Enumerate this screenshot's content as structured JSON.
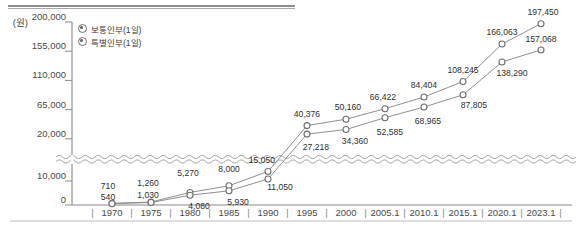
{
  "chart_data": {
    "type": "line",
    "title": "",
    "xlabel": "",
    "ylabel": "",
    "unit_label": "(원)",
    "grid": false,
    "legend_position": "top-left",
    "axis_break": true,
    "ylim": [
      0,
      200000
    ],
    "ytick_labels": [
      "200,000",
      "155,000",
      "110,000",
      "65,000",
      "20,000",
      "10,000",
      "0"
    ],
    "ytick_values": [
      200000,
      155000,
      110000,
      65000,
      20000,
      10000,
      0
    ],
    "categories": [
      "1970",
      "1975",
      "1980",
      "1985",
      "1990",
      "1995",
      "2000",
      "2005.1",
      "2010.1",
      "2015.1",
      "2020.1",
      "2023.1"
    ],
    "series": [
      {
        "name": "보통인부(1일)",
        "values": [
          710,
          1260,
          5270,
          8000,
          15050,
          40376,
          50160,
          66422,
          84404,
          108245,
          166063,
          197450
        ],
        "labels": [
          "710",
          "1,260",
          "5,270",
          "8,000",
          "15,050",
          "40,376",
          "50,160",
          "66,422",
          "84,404",
          "108,245",
          "166,063",
          "197,450"
        ]
      },
      {
        "name": "특별인부(1일)",
        "values": [
          540,
          1030,
          4080,
          5930,
          11050,
          27218,
          34360,
          52585,
          68965,
          87805,
          138290,
          157068
        ],
        "labels": [
          "540",
          "1,030",
          "4,080",
          "5,930",
          "11,050",
          "27,218",
          "34,360",
          "52,585",
          "68,965",
          "87,805",
          "138,290",
          "157,068"
        ]
      }
    ]
  },
  "colors": {
    "line": "#8a8a8a",
    "axis": "#8a8a8a",
    "text": "#3a3a3a",
    "marker_stroke": "#6d6d6d",
    "marker_fill": "#ffffff",
    "top_rule": "#8e8e8e"
  },
  "legend": {
    "items": [
      {
        "label": "보통인부(1일)"
      },
      {
        "label": "특별인부(1일)"
      }
    ]
  },
  "axis": {
    "unit": "(원)",
    "separator": "|"
  }
}
